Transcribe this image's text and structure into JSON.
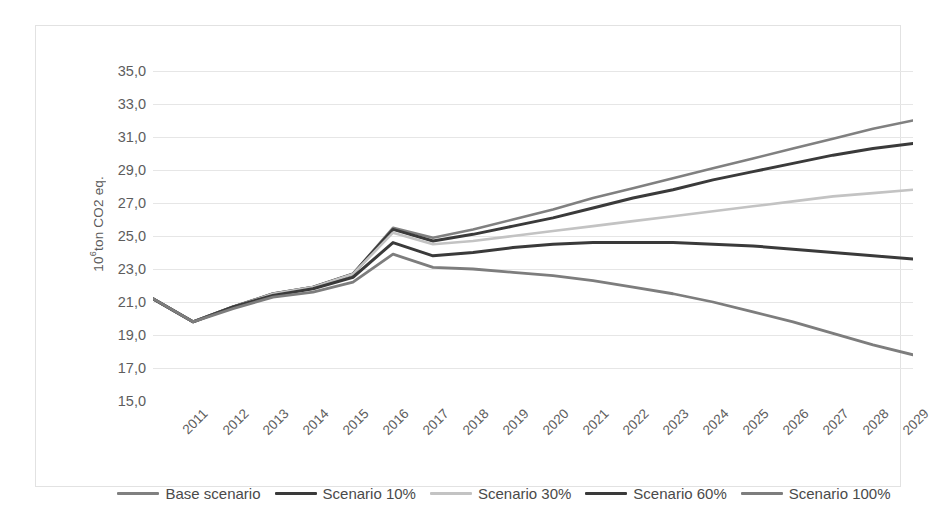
{
  "chart_data": {
    "type": "line",
    "title": "",
    "xlabel": "",
    "ylabel": "10⁶ton CO2 eq.",
    "x": [
      2011,
      2012,
      2013,
      2014,
      2015,
      2016,
      2017,
      2018,
      2019,
      2020,
      2021,
      2022,
      2023,
      2024,
      2025,
      2026,
      2027,
      2028,
      2029,
      2030
    ],
    "ylim": [
      15.0,
      35.0
    ],
    "ytick_step": 2.0,
    "yticks": [
      "35,0",
      "33,0",
      "31,0",
      "29,0",
      "27,0",
      "25,0",
      "23,0",
      "21,0",
      "19,0",
      "17,0",
      "15,0"
    ],
    "ytick_values": [
      35.0,
      33.0,
      31.0,
      29.0,
      27.0,
      25.0,
      23.0,
      21.0,
      19.0,
      17.0,
      15.0
    ],
    "xticks": [
      "2011",
      "2012",
      "2013",
      "2014",
      "2015",
      "2016",
      "2017",
      "2018",
      "2019",
      "2020",
      "2021",
      "2022",
      "2023",
      "2024",
      "2025",
      "2026",
      "2027",
      "2028",
      "2029",
      "2030"
    ],
    "grid": true,
    "legend_position": "bottom",
    "series": [
      {
        "name": "Base scenario",
        "color": "#808080",
        "width": 2.6,
        "values": [
          21.2,
          19.8,
          20.7,
          21.5,
          21.9,
          22.7,
          25.5,
          24.9,
          25.4,
          26.0,
          26.6,
          27.3,
          27.9,
          28.5,
          29.1,
          29.7,
          30.3,
          30.9,
          31.5,
          32.0
        ]
      },
      {
        "name": "Scenario 10%",
        "color": "#3a3a3a",
        "width": 3.0,
        "values": [
          21.2,
          19.8,
          20.7,
          21.5,
          21.9,
          22.7,
          25.4,
          24.7,
          25.1,
          25.6,
          26.1,
          26.7,
          27.3,
          27.8,
          28.4,
          28.9,
          29.4,
          29.9,
          30.3,
          30.6
        ]
      },
      {
        "name": "Scenario 30%",
        "color": "#c3c3c3",
        "width": 2.6,
        "values": [
          21.2,
          19.8,
          20.7,
          21.5,
          21.9,
          22.7,
          25.2,
          24.5,
          24.7,
          25.0,
          25.3,
          25.6,
          25.9,
          26.2,
          26.5,
          26.8,
          27.1,
          27.4,
          27.6,
          27.8
        ]
      },
      {
        "name": "Scenario 60%",
        "color": "#3a3a3a",
        "width": 3.0,
        "values": [
          21.2,
          19.8,
          20.7,
          21.4,
          21.8,
          22.5,
          24.6,
          23.8,
          24.0,
          24.3,
          24.5,
          24.6,
          24.6,
          24.6,
          24.5,
          24.4,
          24.2,
          24.0,
          23.8,
          23.6
        ]
      },
      {
        "name": "Scenario 100%",
        "color": "#7d7d7d",
        "width": 2.8,
        "values": [
          21.2,
          19.8,
          20.6,
          21.3,
          21.6,
          22.2,
          23.9,
          23.1,
          23.0,
          22.8,
          22.6,
          22.3,
          21.9,
          21.5,
          21.0,
          20.4,
          19.8,
          19.1,
          18.4,
          17.8
        ]
      }
    ]
  },
  "legend": {
    "items": [
      {
        "label": "Base scenario"
      },
      {
        "label": "Scenario 10%"
      },
      {
        "label": "Scenario 30%"
      },
      {
        "label": "Scenario 60%"
      },
      {
        "label": "Scenario 100%"
      }
    ]
  }
}
